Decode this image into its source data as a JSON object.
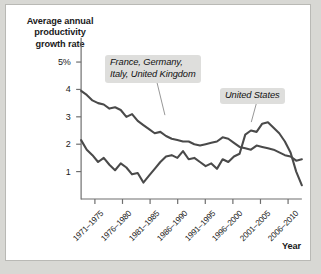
{
  "chart_data": {
    "type": "line",
    "title": "",
    "ylabel": "Average annual\nproductivity\ngrowth rate",
    "xlabel": "Year",
    "ylim": [
      0,
      5.4
    ],
    "ytick_values": [
      5,
      4,
      3,
      2,
      1
    ],
    "ytick_labels": [
      "5%",
      "4",
      "3",
      "2",
      "1"
    ],
    "grid": false,
    "legend_position": "inline-annotations",
    "categories": [
      "1971-1975",
      "1976-1980",
      "1981-1985",
      "1986-1990",
      "1991-1995",
      "1996-2000",
      "2001-2005",
      "2006-2010"
    ],
    "xlim": [
      1971,
      2010
    ],
    "series": [
      {
        "name": "France, Germany, Italy, United Kingdom",
        "color": "#4a4a4a",
        "x": [
          1971,
          1972,
          1973,
          1974,
          1975,
          1976,
          1977,
          1978,
          1979,
          1980,
          1981,
          1982,
          1983,
          1984,
          1985,
          1986,
          1987,
          1988,
          1989,
          1990,
          1991,
          1992,
          1993,
          1994,
          1995,
          1996,
          1997,
          1998,
          1999,
          2000,
          2001,
          2002,
          2003,
          2004,
          2005,
          2006,
          2007,
          2008,
          2009,
          2010
        ],
        "values": [
          3.95,
          3.8,
          3.6,
          3.5,
          3.45,
          3.3,
          3.35,
          3.25,
          3.0,
          3.1,
          2.85,
          2.7,
          2.55,
          2.4,
          2.45,
          2.3,
          2.2,
          2.15,
          2.1,
          2.1,
          2.0,
          1.95,
          2.0,
          2.05,
          2.1,
          2.25,
          2.2,
          2.05,
          1.9,
          1.85,
          1.8,
          1.95,
          1.9,
          1.85,
          1.8,
          1.7,
          1.6,
          1.55,
          1.4,
          1.45
        ]
      },
      {
        "name": "United States",
        "color": "#4a4a4a",
        "x": [
          1971,
          1972,
          1973,
          1974,
          1975,
          1976,
          1977,
          1978,
          1979,
          1980,
          1981,
          1982,
          1983,
          1984,
          1985,
          1986,
          1987,
          1988,
          1989,
          1990,
          1991,
          1992,
          1993,
          1994,
          1995,
          1996,
          1997,
          1998,
          1999,
          2000,
          2001,
          2002,
          2003,
          2004,
          2005,
          2006,
          2007,
          2008,
          2009,
          2010
        ],
        "values": [
          2.15,
          1.8,
          1.6,
          1.35,
          1.5,
          1.25,
          1.05,
          1.3,
          1.15,
          0.9,
          0.95,
          0.6,
          0.85,
          1.1,
          1.35,
          1.55,
          1.6,
          1.5,
          1.75,
          1.45,
          1.5,
          1.35,
          1.2,
          1.3,
          1.1,
          1.45,
          1.35,
          1.55,
          1.65,
          2.35,
          2.5,
          2.45,
          2.75,
          2.8,
          2.6,
          2.4,
          2.1,
          1.7,
          1.0,
          0.5
        ]
      }
    ],
    "annotations": [
      {
        "name": "europe-label",
        "text": "France, Germany,\nItaly, United Kingdom",
        "leader_from": [
          151,
          74
        ],
        "leader_to": [
          160,
          111
        ]
      },
      {
        "name": "us-label",
        "text": "United States",
        "leader_from": [
          253,
          96
        ],
        "leader_to": [
          247,
          118
        ]
      }
    ]
  }
}
